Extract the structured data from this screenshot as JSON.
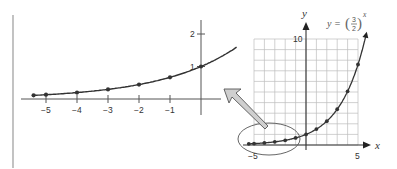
{
  "chart_data": [
    {
      "id": "zoomed-view",
      "type": "line",
      "title": "",
      "xlabel": "",
      "ylabel": "",
      "xlim": [
        -5.4,
        1.1
      ],
      "ylim": [
        -0.6,
        2.3
      ],
      "grid": false,
      "x_ticks": [
        "-5",
        "-4",
        "-3",
        "-2",
        "-1"
      ],
      "y_ticks": [
        "1",
        "2"
      ],
      "series": [
        {
          "name": "y = (3/2)^x",
          "x": [
            -5.4,
            -5,
            -4,
            -3,
            -2,
            -1,
            0
          ],
          "values": [
            0.112,
            0.132,
            0.198,
            0.296,
            0.444,
            0.667,
            1.0
          ]
        }
      ],
      "labels": {
        "x_tick_labels": [
          "−5",
          "−4",
          "−3",
          "−2",
          "−1"
        ],
        "y_tick_labels": [
          "1",
          "2"
        ]
      }
    },
    {
      "id": "full-view",
      "type": "line",
      "title": "",
      "xlabel": "x",
      "ylabel": "y",
      "xlim": [
        -5,
        5
      ],
      "ylim": [
        0,
        10
      ],
      "grid": true,
      "x_ticks": [
        "-5",
        "5"
      ],
      "y_ticks": [
        "10"
      ],
      "annotation": "y = (3/2)^x",
      "series": [
        {
          "name": "y = (3/2)^x",
          "x": [
            -5.5,
            -5,
            -4,
            -3,
            -2,
            -1,
            0,
            1,
            2,
            3,
            4,
            5
          ],
          "values": [
            0.107,
            0.132,
            0.198,
            0.296,
            0.444,
            0.667,
            1.0,
            1.5,
            2.25,
            3.375,
            5.063,
            7.594
          ]
        }
      ],
      "labels": {
        "x_tick_labels": [
          "−5",
          "5"
        ],
        "y_tick_labels": [
          "10"
        ],
        "x_axis_name": "x",
        "y_axis_name": "y",
        "equation_prefix": "y =",
        "fraction_num": "3",
        "fraction_den": "2",
        "exponent": "x"
      }
    }
  ],
  "colors": {
    "curve": "#333333",
    "grid": "#bdbdbd",
    "axis": "#555555",
    "arrow_fill": "#cfcfcf",
    "arrow_stroke": "#555555",
    "frame_line": "#9a9a9a"
  }
}
